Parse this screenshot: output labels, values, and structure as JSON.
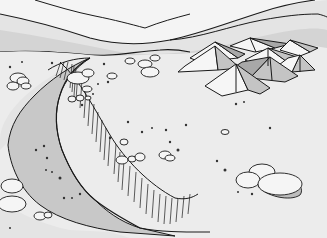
{
  "image": {
    "description": "Black-and-white line illustration of a desert plain with a cluster of pyramid tents, a sloping ravine/cliff edge, scattered pebbles and rocks, and mountain ridges in the background",
    "width": 327,
    "height": 238
  },
  "colors": {
    "sky": "#f4f4f4",
    "far_mountain": "#dcdcdc",
    "mid_mountain": "#d2d2d2",
    "plain": "#ececec",
    "ravine": "#c8c8c8",
    "tent_light": "#f6f6f6",
    "tent_mid": "#c4c4c4",
    "tent_dark": "#a8a8a8",
    "rock": "#f5f5f5",
    "rock_shadow": "#bdbdbd",
    "outline": "#1a1a1a"
  },
  "elements": {
    "mountains": "mountain-ridges",
    "tents": "tent-encampment",
    "ravine": "ravine-cliff",
    "rocks": "boulders-and-pebbles"
  }
}
